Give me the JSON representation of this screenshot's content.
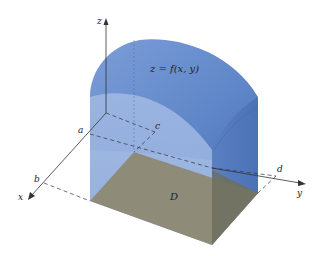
{
  "figure": {
    "surface_label": "z = f(x, y)",
    "region_label": "D",
    "axes": {
      "x": "x",
      "y": "y",
      "z": "z"
    },
    "bounds": {
      "a": "a",
      "b": "b",
      "c": "c",
      "d": "d"
    }
  },
  "colors": {
    "solid_blue": "#6a8fcf",
    "solid_blue_dark": "#4d72b8",
    "solid_blue_light": "#a9c0e6",
    "base_gray": "#8f8c78",
    "base_gray_dark": "#6e6d5e",
    "axis": "#333333"
  }
}
